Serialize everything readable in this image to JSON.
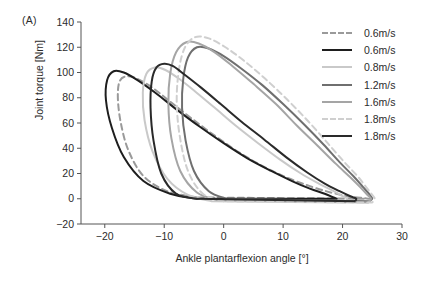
{
  "panel": {
    "label": "(A)"
  },
  "axes": {
    "xlabel": "Ankle plantarflexion angle [°]",
    "ylabel": "Joint torque [Nm]",
    "xticks": [
      "−20",
      "−10",
      "0",
      "10",
      "20",
      "30"
    ],
    "yticks": [
      "−20",
      "0",
      "20",
      "40",
      "60",
      "80",
      "100",
      "120",
      "140"
    ]
  },
  "legend": {
    "entries": [
      {
        "label": "0.6m/s",
        "color": "#9a9a9a",
        "style": "dashed"
      },
      {
        "label": "0.6m/s",
        "color": "#1e1e1e",
        "style": "solid"
      },
      {
        "label": "0.8m/s",
        "color": "#c9c9c9",
        "style": "solid"
      },
      {
        "label": "1.2m/s",
        "color": "#6f6f6f",
        "style": "solid"
      },
      {
        "label": "1.6m/s",
        "color": "#a5a5a5",
        "style": "solid"
      },
      {
        "label": "1.8m/s",
        "color": "#cfcfcf",
        "style": "dashed"
      },
      {
        "label": "1.8m/s",
        "color": "#2a2a2a",
        "style": "solid"
      }
    ]
  },
  "chart_data": {
    "type": "line",
    "title": "",
    "xlabel": "Ankle plantarflexion angle [°]",
    "ylabel": "Joint torque [Nm]",
    "xlim": [
      -24,
      30
    ],
    "ylim": [
      -20,
      140
    ],
    "xticks": [
      -20,
      -10,
      0,
      10,
      20,
      30
    ],
    "yticks": [
      -20,
      0,
      20,
      40,
      60,
      80,
      100,
      120,
      140
    ],
    "grid": false,
    "legend_position": "upper right",
    "note": "Ankle joint torque vs plantarflexion angle hysteresis loops for seven walking speed conditions; loops traverse counter-clockwise, peak torque rises and shifts rightward with increasing speed.",
    "series": [
      {
        "name": "0.6m/s",
        "color": "#9a9a9a",
        "style": "dashed",
        "peak_torque": 97,
        "peak_angle": -17.5,
        "points": [
          [
            -4.5,
            1
          ],
          [
            -9.5,
            6
          ],
          [
            -13.5,
            18
          ],
          [
            -16.0,
            38
          ],
          [
            -17.3,
            60
          ],
          [
            -17.8,
            80
          ],
          [
            -17.5,
            93
          ],
          [
            -16.3,
            97
          ],
          [
            -14.5,
            95
          ],
          [
            -12.0,
            88
          ],
          [
            -9.0,
            77
          ],
          [
            -5.5,
            64
          ],
          [
            -1.5,
            50
          ],
          [
            2.5,
            37
          ],
          [
            6.5,
            26
          ],
          [
            10.5,
            17
          ],
          [
            14.5,
            10
          ],
          [
            18.0,
            5
          ],
          [
            21.0,
            2
          ],
          [
            23.5,
            0.5
          ],
          [
            24.5,
            0
          ]
        ]
      },
      {
        "name": "0.6m/s",
        "color": "#1e1e1e",
        "style": "solid",
        "peak_torque": 101,
        "peak_angle": -19.5,
        "points": [
          [
            -4.5,
            0
          ],
          [
            -9.0,
            4
          ],
          [
            -13.5,
            14
          ],
          [
            -16.8,
            33
          ],
          [
            -18.8,
            56
          ],
          [
            -19.8,
            78
          ],
          [
            -19.6,
            94
          ],
          [
            -18.5,
            101
          ],
          [
            -16.8,
            100
          ],
          [
            -14.5,
            94
          ],
          [
            -11.5,
            84
          ],
          [
            -8.0,
            71
          ],
          [
            -4.0,
            57
          ],
          [
            0.0,
            44
          ],
          [
            4.0,
            32
          ],
          [
            8.0,
            22
          ],
          [
            11.5,
            14
          ],
          [
            14.5,
            8
          ],
          [
            17.0,
            4
          ],
          [
            18.5,
            1
          ],
          [
            19.0,
            0
          ]
        ]
      },
      {
        "name": "0.8m/s",
        "color": "#c9c9c9",
        "style": "solid",
        "peak_torque": 104,
        "peak_angle": -13.5,
        "points": [
          [
            -2.0,
            -2
          ],
          [
            -6.0,
            3
          ],
          [
            -9.5,
            16
          ],
          [
            -12.0,
            38
          ],
          [
            -13.3,
            62
          ],
          [
            -13.6,
            84
          ],
          [
            -13.0,
            99
          ],
          [
            -11.6,
            104
          ],
          [
            -9.8,
            102
          ],
          [
            -7.5,
            95
          ],
          [
            -4.8,
            85
          ],
          [
            -1.5,
            72
          ],
          [
            2.0,
            58
          ],
          [
            5.8,
            44
          ],
          [
            9.5,
            31
          ],
          [
            13.0,
            20
          ],
          [
            16.0,
            12
          ],
          [
            18.5,
            6
          ],
          [
            20.0,
            2
          ],
          [
            20.8,
            0
          ],
          [
            20.5,
            -3
          ]
        ]
      },
      {
        "name": "1.2m/s",
        "color": "#6f6f6f",
        "style": "solid",
        "peak_torque": 120,
        "peak_angle": -6.5,
        "points": [
          [
            0.5,
            0
          ],
          [
            -2.5,
            6
          ],
          [
            -5.0,
            22
          ],
          [
            -6.4,
            46
          ],
          [
            -7.0,
            72
          ],
          [
            -6.8,
            95
          ],
          [
            -6.0,
            112
          ],
          [
            -4.5,
            120
          ],
          [
            -2.5,
            119
          ],
          [
            0.0,
            113
          ],
          [
            3.0,
            103
          ],
          [
            6.5,
            90
          ],
          [
            10.0,
            75
          ],
          [
            13.5,
            59
          ],
          [
            16.8,
            43
          ],
          [
            19.5,
            29
          ],
          [
            21.8,
            18
          ],
          [
            23.5,
            9
          ],
          [
            24.6,
            3
          ],
          [
            25.0,
            0
          ],
          [
            24.5,
            -2
          ]
        ]
      },
      {
        "name": "1.6m/s",
        "color": "#a5a5a5",
        "style": "solid",
        "peak_torque": 124,
        "peak_angle": -9.0,
        "points": [
          [
            -1.0,
            -1
          ],
          [
            -4.5,
            5
          ],
          [
            -7.3,
            22
          ],
          [
            -8.8,
            48
          ],
          [
            -9.3,
            75
          ],
          [
            -9.0,
            99
          ],
          [
            -8.0,
            116
          ],
          [
            -6.3,
            124
          ],
          [
            -4.2,
            123
          ],
          [
            -1.5,
            116
          ],
          [
            1.5,
            105
          ],
          [
            5.0,
            91
          ],
          [
            8.8,
            75
          ],
          [
            12.3,
            58
          ],
          [
            15.8,
            42
          ],
          [
            18.8,
            28
          ],
          [
            21.3,
            17
          ],
          [
            23.0,
            9
          ],
          [
            24.2,
            3
          ],
          [
            24.8,
            0
          ],
          [
            24.3,
            -3
          ]
        ]
      },
      {
        "name": "1.8m/s",
        "color": "#cfcfcf",
        "style": "dashed",
        "peak_torque": 128,
        "peak_angle": -7.5,
        "points": [
          [
            0.0,
            -2
          ],
          [
            -3.5,
            4
          ],
          [
            -6.0,
            22
          ],
          [
            -7.4,
            50
          ],
          [
            -7.9,
            78
          ],
          [
            -7.5,
            103
          ],
          [
            -6.5,
            120
          ],
          [
            -4.8,
            128
          ],
          [
            -2.5,
            127
          ],
          [
            0.3,
            120
          ],
          [
            3.5,
            109
          ],
          [
            7.0,
            95
          ],
          [
            10.8,
            78
          ],
          [
            14.3,
            61
          ],
          [
            17.5,
            44
          ],
          [
            20.3,
            29
          ],
          [
            22.5,
            18
          ],
          [
            24.0,
            9
          ],
          [
            25.0,
            3
          ],
          [
            25.4,
            0
          ],
          [
            25.0,
            -3
          ]
        ]
      },
      {
        "name": "1.8m/s",
        "color": "#2a2a2a",
        "style": "solid",
        "peak_torque": 107,
        "peak_angle": -12.0,
        "points": [
          [
            -4.5,
            0
          ],
          [
            -8.0,
            4
          ],
          [
            -10.5,
            20
          ],
          [
            -11.8,
            46
          ],
          [
            -12.3,
            72
          ],
          [
            -12.1,
            93
          ],
          [
            -11.3,
            104
          ],
          [
            -10.0,
            107
          ],
          [
            -8.5,
            105
          ],
          [
            -6.5,
            98
          ],
          [
            -3.8,
            88
          ],
          [
            -0.5,
            75
          ],
          [
            3.0,
            61
          ],
          [
            6.8,
            47
          ],
          [
            10.5,
            33
          ],
          [
            14.0,
            21
          ],
          [
            17.0,
            12
          ],
          [
            19.5,
            6
          ],
          [
            21.3,
            2
          ],
          [
            22.3,
            0
          ],
          [
            22.0,
            -2
          ]
        ]
      }
    ]
  }
}
